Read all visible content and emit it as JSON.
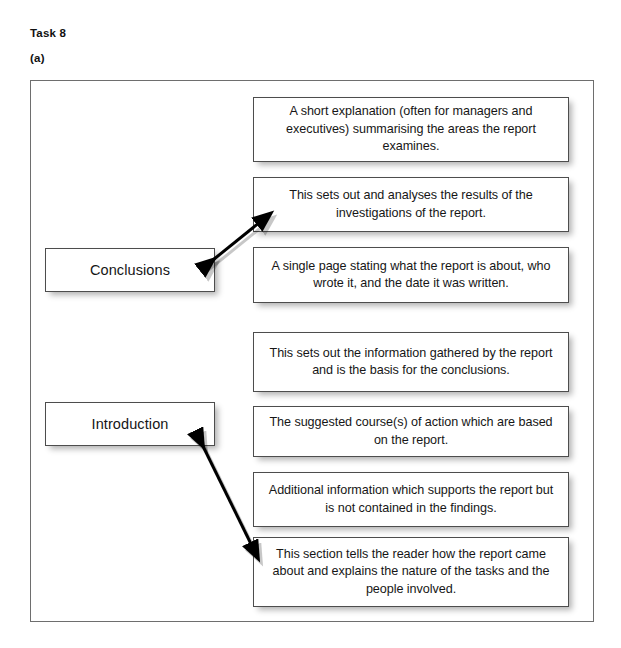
{
  "headings": {
    "task": "Task 8",
    "part": "(a)"
  },
  "colors": {
    "frame_border": "#6e6e6e",
    "box_border": "#4d4d4d",
    "box_fill": "#ffffff",
    "text": "#161616",
    "arrow": "#000000",
    "page_background": "#ffffff"
  },
  "label_boxes": [
    {
      "id": "conclusions",
      "label": "Conclusions",
      "x": 45,
      "y": 248,
      "width": 170,
      "height": 44
    },
    {
      "id": "introduction",
      "label": "Introduction",
      "x": 45,
      "y": 402,
      "width": 170,
      "height": 44
    }
  ],
  "description_boxes": [
    {
      "id": "executive-summary",
      "text": "A short explanation (often for managers and executives) summarising the areas the report examines.",
      "x": 253,
      "y": 97,
      "width": 316,
      "height": 65
    },
    {
      "id": "conclusions-description",
      "text": "This sets out and analyses the results of the investigations of the report.",
      "x": 253,
      "y": 177,
      "width": 316,
      "height": 55
    },
    {
      "id": "title-page",
      "text": "A single page stating what the report is about, who wrote it, and the date it was written.",
      "x": 253,
      "y": 247,
      "width": 316,
      "height": 56
    },
    {
      "id": "findings",
      "text": "This sets out the information gathered by the report and is the basis for the conclusions.",
      "x": 253,
      "y": 332,
      "width": 316,
      "height": 60
    },
    {
      "id": "recommendations",
      "text": "The suggested course(s) of action which are based on the report.",
      "x": 253,
      "y": 406,
      "width": 316,
      "height": 51
    },
    {
      "id": "appendices",
      "text": "Additional information which supports the report but is not contained in the findings.",
      "x": 253,
      "y": 472,
      "width": 316,
      "height": 55
    },
    {
      "id": "introduction-description",
      "text": "This section tells the reader how the report came about and explains the nature of the tasks and the people involved.",
      "x": 253,
      "y": 537,
      "width": 316,
      "height": 70
    }
  ],
  "connectors": [
    {
      "id": "conclusions-connector",
      "from": "conclusions",
      "to": "conclusions-description",
      "x1": 203,
      "y1": 268,
      "x2": 260,
      "y2": 222,
      "double_headed": true
    },
    {
      "id": "introduction-connector",
      "from": "introduction",
      "to": "introduction-description",
      "x1": 197,
      "y1": 434,
      "x2": 252,
      "y2": 546,
      "double_headed": true
    }
  ],
  "frame": {
    "x": 30,
    "y": 80,
    "width": 564,
    "height": 542
  }
}
